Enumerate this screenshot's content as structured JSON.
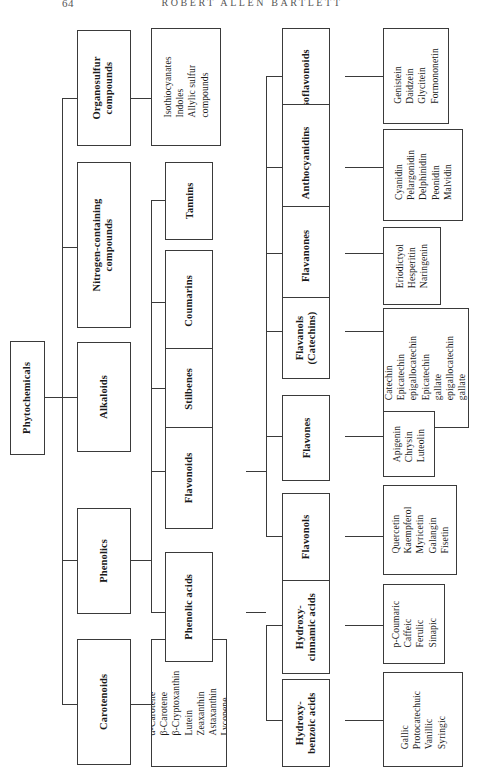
{
  "running_head": {
    "page_number": "64",
    "author": "ROBERT ALLEN BARTLETT"
  },
  "figure": {
    "root": "Phytochemicals",
    "level1": [
      "Organosulfur compounds",
      "Nitrogen-containing compounds",
      "Alkaloids",
      "Phenolics",
      "Carotenoids"
    ],
    "level2": [
      "Tannins",
      "Coumarins",
      "Stilbenes",
      "Flavonoids",
      "Phenolic acids"
    ],
    "level3": [
      "Isoflavonoids",
      "Anthocyanidins",
      "Flavanones",
      "Flavanols (Catechins)",
      "Flavones",
      "Flavonols",
      "Hydroxy-cinnamic acids",
      "Hydroxy-benzoic acids"
    ],
    "nodes": {
      "root": {
        "label": "Phytochemicals"
      },
      "organosulfur": {
        "label_line1": "Organosulfur",
        "label_line2": "compounds"
      },
      "nitrogen": {
        "label_line1": "Nitrogen-containing",
        "label_line2": "compounds"
      },
      "alkaloids": {
        "label": "Alkaloids"
      },
      "phenolics": {
        "label": "Phenolics"
      },
      "carotenoids": {
        "label": "Carotenoids"
      },
      "tannins": {
        "label": "Tannins"
      },
      "coumarins": {
        "label": "Coumarins"
      },
      "stilbenes": {
        "label": "Stilbenes"
      },
      "flavonoids": {
        "label": "Flavonoids"
      },
      "phenolic_acids": {
        "label": "Phenolic acids"
      },
      "isoflavonoids": {
        "label": "Isoflavonoids"
      },
      "anthocyanidins": {
        "label": "Anthocyanidins"
      },
      "flavanones": {
        "label": "Flavanones"
      },
      "flavanols": {
        "label_line1": "Flavanols",
        "label_line2": "(Catechins)"
      },
      "flavones": {
        "label": "Flavones"
      },
      "flavonols": {
        "label": "Flavonols"
      },
      "hydroxycinnamic": {
        "label_line1": "Hydroxy-",
        "label_line2": "cinnamic acids"
      },
      "hydroxybenzoic": {
        "label_line1": "Hydroxy-",
        "label_line2": "benzoic acids"
      }
    },
    "leaves": {
      "organosulfur_items": [
        "Isothiocyanates",
        "Indoles",
        "Allylic sulfur",
        "compounds"
      ],
      "carotenoid_items": [
        "α-Carotene",
        "β-Carotene",
        "β-Cryptoxanthin",
        "Lutein",
        "Zeaxanthin",
        "Astaxanthin",
        "Lycopene"
      ],
      "isoflavonoid_items": [
        "Genistein",
        "Daidzein",
        "Glycitein",
        "Formononetin"
      ],
      "anthocyanidin_items": [
        "Cyanidin",
        "Pelargonidin",
        "Delphinidin",
        "Peonidin",
        "Malvidin"
      ],
      "flavanone_items": [
        "Eriodictyol",
        "Hesperitin",
        "Naringenin"
      ],
      "flavanol_items": [
        "Catechin",
        "Epicatechin",
        "epigallocatechin",
        "Epicatechin",
        "gallate",
        "epigallocatechin",
        "gallate"
      ],
      "flavone_items": [
        "Apigenin",
        "Chrysin",
        "Luteolin"
      ],
      "flavonol_items": [
        "Quercetin",
        "Kaempferol",
        "Myricetin",
        "Galangin",
        "Fisetin"
      ],
      "hydroxycinnamic_items": [
        "p-Coumaric",
        "Caffeic",
        "Ferulic",
        "Sinapic"
      ],
      "hydroxybenzoic_items": [
        "Gallic",
        "Protocatechuic",
        "Vanillic",
        "Syringic"
      ]
    },
    "colors": {
      "ink": "#1a1a1a",
      "rule": "#3a3a3a",
      "paper": "#ffffff",
      "head": "#555555"
    }
  }
}
